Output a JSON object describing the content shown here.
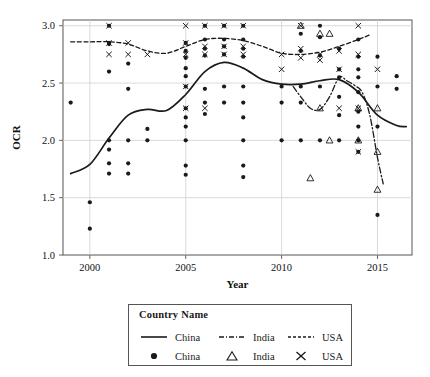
{
  "chart_data": {
    "type": "scatter",
    "title": "",
    "xlabel": "Year",
    "ylabel": "OCR",
    "xlim": [
      1998.6,
      2016.8
    ],
    "ylim": [
      1.0,
      3.05
    ],
    "xticks": [
      2000,
      2005,
      2010,
      2015
    ],
    "yticks": [
      "1.0",
      "1.5",
      "2.0",
      "2.5",
      "3.0"
    ],
    "grid": true,
    "legend_position": "below-plot",
    "legend_title": "Country Name",
    "series": [
      {
        "name": "China",
        "kind": "marker",
        "marker": "filled-circle",
        "color": "#1a1a1a",
        "points": [
          [
            1999.0,
            2.33
          ],
          [
            2000.0,
            1.46
          ],
          [
            2000.0,
            1.23
          ],
          [
            2001.0,
            3.0
          ],
          [
            2001.0,
            2.85
          ],
          [
            2001.0,
            2.84
          ],
          [
            2001.0,
            2.6
          ],
          [
            2001.0,
            2.0
          ],
          [
            2001.0,
            1.92
          ],
          [
            2001.0,
            1.8
          ],
          [
            2001.0,
            1.71
          ],
          [
            2002.0,
            2.67
          ],
          [
            2002.0,
            2.45
          ],
          [
            2002.0,
            2.0
          ],
          [
            2002.0,
            1.8
          ],
          [
            2002.0,
            1.71
          ],
          [
            2003.0,
            2.1
          ],
          [
            2003.0,
            2.0
          ],
          [
            2005.0,
            2.85
          ],
          [
            2005.0,
            2.78
          ],
          [
            2005.0,
            2.72
          ],
          [
            2005.0,
            2.63
          ],
          [
            2005.0,
            2.56
          ],
          [
            2005.0,
            2.47
          ],
          [
            2005.0,
            2.28
          ],
          [
            2005.0,
            2.2
          ],
          [
            2005.0,
            2.12
          ],
          [
            2005.0,
            2.0
          ],
          [
            2005.0,
            1.78
          ],
          [
            2005.0,
            1.7
          ],
          [
            2006.0,
            3.0
          ],
          [
            2006.0,
            2.88
          ],
          [
            2006.0,
            2.8
          ],
          [
            2006.0,
            2.74
          ],
          [
            2006.0,
            2.45
          ],
          [
            2006.0,
            2.33
          ],
          [
            2006.0,
            2.23
          ],
          [
            2007.0,
            3.0
          ],
          [
            2007.0,
            2.88
          ],
          [
            2007.0,
            2.82
          ],
          [
            2007.0,
            2.75
          ],
          [
            2007.0,
            2.47
          ],
          [
            2007.0,
            2.33
          ],
          [
            2008.0,
            3.0
          ],
          [
            2008.0,
            2.88
          ],
          [
            2008.0,
            2.8
          ],
          [
            2008.0,
            2.73
          ],
          [
            2008.0,
            2.47
          ],
          [
            2008.0,
            2.33
          ],
          [
            2008.0,
            2.2
          ],
          [
            2008.0,
            2.0
          ],
          [
            2008.0,
            1.78
          ],
          [
            2008.0,
            1.68
          ],
          [
            2010.0,
            2.47
          ],
          [
            2010.0,
            2.33
          ],
          [
            2010.0,
            2.0
          ],
          [
            2011.0,
            2.93
          ],
          [
            2011.0,
            2.78
          ],
          [
            2011.0,
            2.47
          ],
          [
            2011.0,
            2.33
          ],
          [
            2011.0,
            2.0
          ],
          [
            2012.0,
            3.0
          ],
          [
            2012.0,
            2.9
          ],
          [
            2012.0,
            2.74
          ],
          [
            2012.0,
            2.47
          ],
          [
            2012.0,
            2.0
          ],
          [
            2013.0,
            2.8
          ],
          [
            2013.0,
            2.62
          ],
          [
            2013.0,
            2.55
          ],
          [
            2013.0,
            2.38
          ],
          [
            2013.0,
            2.22
          ],
          [
            2013.0,
            2.0
          ],
          [
            2014.0,
            2.88
          ],
          [
            2014.0,
            2.73
          ],
          [
            2014.0,
            2.62
          ],
          [
            2014.0,
            2.55
          ],
          [
            2014.0,
            2.42
          ],
          [
            2014.0,
            2.25
          ],
          [
            2014.0,
            2.12
          ],
          [
            2014.0,
            2.0
          ],
          [
            2014.0,
            1.9
          ],
          [
            2015.0,
            2.73
          ],
          [
            2015.0,
            2.47
          ],
          [
            2015.0,
            2.12
          ],
          [
            2015.0,
            1.35
          ],
          [
            2016.0,
            2.56
          ],
          [
            2016.0,
            2.45
          ]
        ]
      },
      {
        "name": "India",
        "kind": "marker",
        "marker": "open-triangle",
        "color": "#1a1a1a",
        "points": [
          [
            2011.0,
            3.0
          ],
          [
            2012.0,
            2.93
          ],
          [
            2012.5,
            2.93
          ],
          [
            2012.0,
            2.28
          ],
          [
            2012.5,
            2.0
          ],
          [
            2011.5,
            1.67
          ],
          [
            2014.0,
            2.28
          ],
          [
            2014.0,
            2.0
          ],
          [
            2015.0,
            2.28
          ],
          [
            2015.0,
            1.9
          ],
          [
            2015.0,
            1.57
          ]
        ]
      },
      {
        "name": "USA",
        "kind": "marker",
        "marker": "cross-x",
        "color": "#1a1a1a",
        "points": [
          [
            2001.0,
            3.0
          ],
          [
            2001.0,
            2.85
          ],
          [
            2001.0,
            2.75
          ],
          [
            2002.0,
            2.85
          ],
          [
            2002.0,
            2.75
          ],
          [
            2003.0,
            2.75
          ],
          [
            2005.0,
            3.0
          ],
          [
            2005.0,
            2.85
          ],
          [
            2005.0,
            2.75
          ],
          [
            2005.0,
            2.47
          ],
          [
            2005.0,
            2.28
          ],
          [
            2006.0,
            3.0
          ],
          [
            2006.0,
            2.82
          ],
          [
            2006.0,
            2.75
          ],
          [
            2006.0,
            2.28
          ],
          [
            2007.0,
            3.0
          ],
          [
            2007.0,
            2.82
          ],
          [
            2007.0,
            2.75
          ],
          [
            2008.0,
            3.0
          ],
          [
            2008.0,
            2.82
          ],
          [
            2008.0,
            2.75
          ],
          [
            2010.0,
            2.75
          ],
          [
            2010.0,
            2.62
          ],
          [
            2011.0,
            3.0
          ],
          [
            2011.0,
            2.8
          ],
          [
            2011.0,
            2.72
          ],
          [
            2012.0,
            2.75
          ],
          [
            2012.0,
            2.7
          ],
          [
            2013.0,
            2.78
          ],
          [
            2013.0,
            2.62
          ],
          [
            2013.0,
            2.28
          ],
          [
            2014.0,
            3.0
          ],
          [
            2014.0,
            2.75
          ],
          [
            2014.0,
            2.28
          ],
          [
            2014.0,
            1.9
          ],
          [
            2015.0,
            2.62
          ]
        ]
      },
      {
        "name": "China",
        "kind": "line",
        "style": "solid",
        "color": "#1a1a1a",
        "x": [
          1999.0,
          2000.0,
          2001.0,
          2002.0,
          2003.0,
          2004.0,
          2005.0,
          2006.0,
          2007.0,
          2008.0,
          2009.0,
          2010.0,
          2011.0,
          2012.0,
          2013.0,
          2014.0,
          2015.0,
          2016.0,
          2016.5
        ],
        "y": [
          1.71,
          1.79,
          2.02,
          2.22,
          2.27,
          2.26,
          2.4,
          2.6,
          2.68,
          2.63,
          2.53,
          2.49,
          2.49,
          2.52,
          2.53,
          2.42,
          2.22,
          2.13,
          2.12
        ]
      },
      {
        "name": "India",
        "kind": "line",
        "style": "dash-dot",
        "color": "#1a1a1a",
        "x": [
          2010.6,
          2011.0,
          2011.5,
          2012.0,
          2012.5,
          2013.0,
          2013.4,
          2013.8,
          2014.2,
          2014.6,
          2015.0,
          2015.3
        ],
        "y": [
          2.47,
          2.38,
          2.28,
          2.27,
          2.38,
          2.55,
          2.52,
          2.48,
          2.42,
          2.22,
          1.85,
          1.62
        ]
      },
      {
        "name": "USA",
        "kind": "line",
        "style": "dashed",
        "color": "#1a1a1a",
        "x": [
          1999.0,
          2000.0,
          2001.0,
          2002.0,
          2003.0,
          2004.0,
          2005.0,
          2006.0,
          2007.0,
          2008.0,
          2009.0,
          2010.0,
          2011.0,
          2012.0,
          2013.0,
          2014.0,
          2014.6
        ],
        "y": [
          2.86,
          2.86,
          2.86,
          2.84,
          2.78,
          2.76,
          2.82,
          2.88,
          2.89,
          2.87,
          2.82,
          2.76,
          2.75,
          2.77,
          2.82,
          2.88,
          2.92
        ]
      }
    ]
  },
  "legend": {
    "title": "Country Name",
    "line_row": [
      {
        "label": "China",
        "key": "solid-line-key"
      },
      {
        "label": "India",
        "key": "dash-dot-line-key"
      },
      {
        "label": "USA",
        "key": "dashed-line-key"
      }
    ],
    "marker_row": [
      {
        "label": "China",
        "key": "filled-circle-key"
      },
      {
        "label": "India",
        "key": "open-triangle-key"
      },
      {
        "label": "USA",
        "key": "cross-x-key"
      }
    ]
  }
}
